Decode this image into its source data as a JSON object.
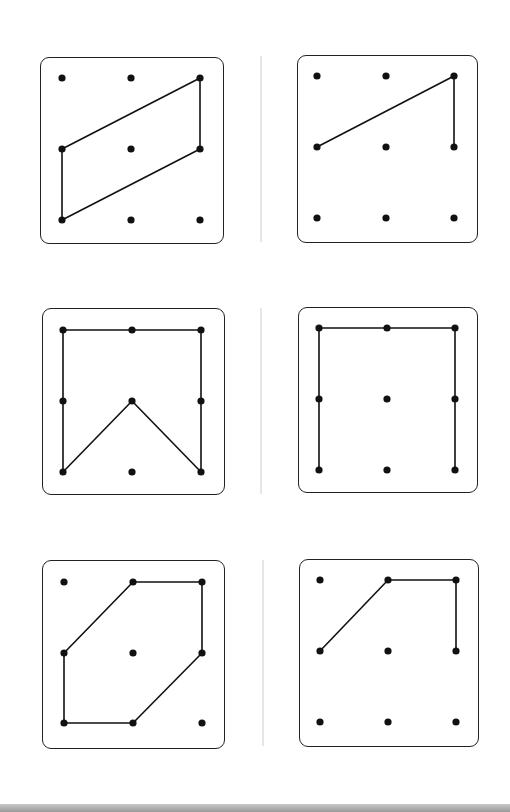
{
  "style": {
    "ink": "#111111",
    "border": "#222222",
    "divider": "#e6e6e6",
    "background": "#ffffff"
  },
  "grid": {
    "rows": 3,
    "cols": 3
  },
  "boards": [
    {
      "id": "board-1",
      "rect": {
        "left": 40,
        "top": 57,
        "width": 184,
        "height": 187
      },
      "dot_x": [
        23,
        92,
        161
      ],
      "dot_y": [
        22,
        93,
        164
      ],
      "closed": true,
      "path": [
        [
          2,
          0
        ],
        [
          2,
          1
        ],
        [
          0,
          2
        ],
        [
          0,
          1
        ]
      ]
    },
    {
      "id": "board-2",
      "rect": {
        "left": 297,
        "top": 55,
        "width": 181,
        "height": 188
      },
      "dot_x": [
        21,
        90,
        158
      ],
      "dot_y": [
        22,
        93,
        164
      ],
      "closed": false,
      "path": [
        [
          0,
          1
        ],
        [
          2,
          0
        ],
        [
          2,
          1
        ]
      ]
    },
    {
      "id": "board-3",
      "rect": {
        "left": 42,
        "top": 308,
        "width": 183,
        "height": 187
      },
      "dot_x": [
        22,
        91,
        160
      ],
      "dot_y": [
        23,
        94,
        165
      ],
      "closed": true,
      "path": [
        [
          0,
          0
        ],
        [
          1,
          0
        ],
        [
          2,
          0
        ],
        [
          2,
          1
        ],
        [
          2,
          2
        ],
        [
          1,
          1
        ],
        [
          0,
          2
        ],
        [
          0,
          1
        ]
      ]
    },
    {
      "id": "board-4",
      "rect": {
        "left": 298,
        "top": 307,
        "width": 180,
        "height": 186
      },
      "dot_x": [
        22,
        90,
        158
      ],
      "dot_y": [
        22,
        93,
        164
      ],
      "closed": false,
      "path": [
        [
          0,
          2
        ],
        [
          0,
          1
        ],
        [
          0,
          0
        ],
        [
          1,
          0
        ],
        [
          2,
          0
        ],
        [
          2,
          1
        ],
        [
          2,
          2
        ]
      ]
    },
    {
      "id": "board-5",
      "rect": {
        "left": 42,
        "top": 560,
        "width": 183,
        "height": 189
      },
      "dot_x": [
        23,
        92,
        161
      ],
      "dot_y": [
        23,
        94,
        164
      ],
      "closed": true,
      "path": [
        [
          1,
          0
        ],
        [
          2,
          0
        ],
        [
          2,
          1
        ],
        [
          1,
          2
        ],
        [
          0,
          2
        ],
        [
          0,
          1
        ]
      ]
    },
    {
      "id": "board-6",
      "rect": {
        "left": 299,
        "top": 559,
        "width": 180,
        "height": 188
      },
      "dot_x": [
        22,
        90,
        158
      ],
      "dot_y": [
        22,
        93,
        164
      ],
      "closed": false,
      "path": [
        [
          0,
          1
        ],
        [
          1,
          0
        ],
        [
          2,
          0
        ],
        [
          2,
          1
        ]
      ]
    }
  ],
  "dividers": [
    {
      "left": 260,
      "top": 56,
      "height": 186
    },
    {
      "left": 260,
      "top": 308,
      "height": 186
    },
    {
      "left": 262,
      "top": 560,
      "height": 186
    }
  ]
}
